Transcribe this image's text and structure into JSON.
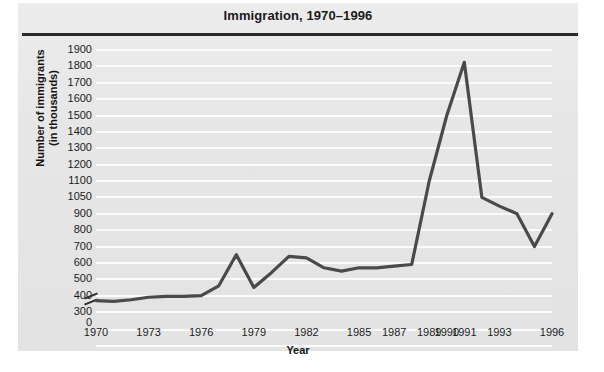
{
  "chart_data": {
    "type": "line",
    "title": "Immigration, 1970–1996",
    "xlabel": "Year",
    "ylabel": "Number of immigrants (in thousands)",
    "ylabel_line1": "Number of immigrants",
    "ylabel_line2": "(in thousands)",
    "grid": true,
    "legend": "none",
    "axis_break": true,
    "axis_break_note": "y-axis broken between 0 and 300",
    "ylim": [
      300,
      1900
    ],
    "y_ticks": [
      300,
      400,
      500,
      600,
      700,
      800,
      900,
      1050,
      1100,
      1200,
      1300,
      1400,
      1500,
      1600,
      1700,
      1800,
      1900
    ],
    "y_zero_tick": "0",
    "x_ticks": [
      "1970",
      "1973",
      "1976",
      "1979",
      "1982",
      "1985",
      "1987",
      "1989",
      "1990",
      "1991",
      "1993",
      "1996"
    ],
    "xlim": [
      1970,
      1996
    ],
    "x": [
      1970,
      1971,
      1972,
      1973,
      1974,
      1975,
      1976,
      1977,
      1978,
      1979,
      1980,
      1981,
      1982,
      1983,
      1984,
      1985,
      1986,
      1987,
      1988,
      1989,
      1990,
      1991,
      1992,
      1993,
      1994,
      1995,
      1996
    ],
    "values": [
      370,
      365,
      375,
      390,
      395,
      395,
      400,
      460,
      650,
      450,
      540,
      640,
      630,
      570,
      550,
      570,
      570,
      580,
      590,
      1100,
      1500,
      1825,
      1050,
      970,
      900,
      700,
      900
    ],
    "series": [
      {
        "name": "Number of immigrants (in thousands)",
        "color": "#4a4a4a",
        "values": [
          370,
          365,
          375,
          390,
          395,
          395,
          400,
          460,
          650,
          450,
          540,
          640,
          630,
          570,
          550,
          570,
          570,
          580,
          590,
          1100,
          1500,
          1825,
          1050,
          970,
          900,
          700,
          900
        ]
      }
    ],
    "colors": {
      "line": "#4a4a4a",
      "panel_background": "#e8e8e8",
      "gridline": "#fbfbfb",
      "title_rule": "#2b2b2b",
      "text": "#1c1c1c"
    }
  }
}
